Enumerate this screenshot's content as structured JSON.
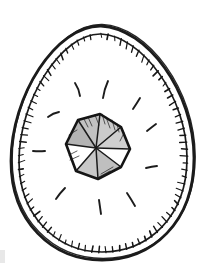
{
  "illustration": {
    "alt": "Hand-drawn ink illustration of an egg with a stitched double outline containing a faceted gem surrounded by radiating sparkle dashes",
    "paper_color": "#ffffff",
    "ink_color": "#1b1b1b",
    "smudge_color": "#d9d9d9"
  },
  "egg": {
    "outer_path": "M101,26 C147,28 194,92 194,158 C194,223 152,260 102,260 C52,260 11,222 11,161 C11,96 56,25 101,26 Z",
    "outer_stroke_width": 2.8,
    "double_line_offset": {
      "x": 1.2,
      "y": -1.6
    },
    "double_line_stroke_width": 1.3,
    "inner_path": "M101,34 C142,36 187,97 187,158 C187,217 148,252 102,252 C56,252 19,215 19,161 C19,101 61,33 101,34 Z",
    "inner_stroke_width": 1.7,
    "center": {
      "x": 102,
      "y": 148
    },
    "ticks": {
      "step": 7,
      "min_len": 3.5,
      "len_jitter": 3.5,
      "angle_jitter": 0.36,
      "min_width": 1.0,
      "width_jitter": 0.7,
      "back_offset": 0.8,
      "color": "#161616"
    }
  },
  "gem": {
    "center": {
      "x": 96,
      "y": 148
    },
    "vertices": [
      [
        78,
        120
      ],
      [
        100,
        114
      ],
      [
        121,
        127
      ],
      [
        130,
        149
      ],
      [
        121,
        167
      ],
      [
        98,
        179
      ],
      [
        76,
        171
      ],
      [
        66,
        144
      ]
    ],
    "facet_fills": [
      "#c2c2c2",
      "#cbcbcb",
      "#d0d0d0",
      "#ffffff",
      "#bfbfbf",
      "#c8c8c8",
      "#ffffff",
      "#b4b4b4"
    ],
    "outline_color": "#151515",
    "outline_width": 2.6,
    "ridge_color": "#1a1a1a",
    "ridge_width": 1.5,
    "hatch_color": "#2b2b2b",
    "hatch_width": 0.9,
    "hatches": [
      [
        [
          88,
          117
        ],
        [
          92,
          126
        ]
      ],
      [
        [
          95,
          115
        ],
        [
          99,
          125
        ]
      ],
      [
        [
          102,
          114
        ],
        [
          105,
          124
        ]
      ],
      [
        [
          84,
          119
        ],
        [
          88,
          127
        ]
      ],
      [
        [
          106,
          117
        ],
        [
          110,
          128
        ]
      ],
      [
        [
          112,
          120
        ],
        [
          115,
          130
        ]
      ],
      [
        [
          117,
          124
        ],
        [
          119,
          132
        ]
      ],
      [
        [
          124,
          133
        ],
        [
          120,
          141
        ]
      ],
      [
        [
          101,
          174
        ],
        [
          113,
          167
        ]
      ],
      [
        [
          99,
          177
        ],
        [
          110,
          171
        ]
      ],
      [
        [
          70,
          160
        ],
        [
          79,
          156
        ]
      ],
      [
        [
          69,
          155
        ],
        [
          77,
          151
        ]
      ],
      [
        [
          69,
          135
        ],
        [
          77,
          130
        ]
      ]
    ]
  },
  "sparkles": {
    "color": "#1c1c1c",
    "stroke_width": 1.9,
    "rays": [
      "M75,83 Q79,89 80,96",
      "M108,81 Q104,90 103,98",
      "M133,109 Q137,103 140,98",
      "M147,131 Q152,127 156,124",
      "M146,168 Q152,166.5 157,166",
      "M127,193 Q131,199 135,206",
      "M99,200 Q100,207 101,214",
      "M65,188 Q60,193 56,199",
      "M33,151 Q39,151.5 45,151",
      "M48,117 Q53,113 59,112"
    ]
  },
  "smudge": {
    "x": 0,
    "y": 250,
    "width": 5,
    "height": 13
  }
}
